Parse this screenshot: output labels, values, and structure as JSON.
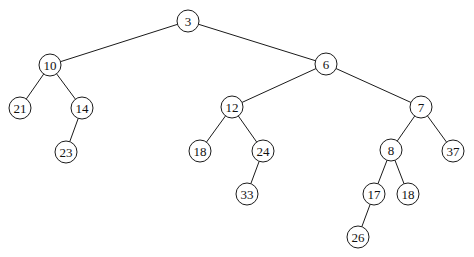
{
  "diagram": {
    "type": "binary-tree",
    "colors": {
      "stroke": "#1a1a1a",
      "fill": "#ffffff",
      "text": "#111111"
    },
    "node_radius": 11,
    "nodes": [
      {
        "id": "n3",
        "label": "3",
        "x": 188,
        "y": 21
      },
      {
        "id": "n10",
        "label": "10",
        "x": 50,
        "y": 65
      },
      {
        "id": "n6",
        "label": "6",
        "x": 326,
        "y": 64
      },
      {
        "id": "n21",
        "label": "21",
        "x": 20,
        "y": 108
      },
      {
        "id": "n14",
        "label": "14",
        "x": 82,
        "y": 108
      },
      {
        "id": "n12",
        "label": "12",
        "x": 232,
        "y": 107
      },
      {
        "id": "n7",
        "label": "7",
        "x": 421,
        "y": 107
      },
      {
        "id": "n23",
        "label": "23",
        "x": 66,
        "y": 152
      },
      {
        "id": "n18a",
        "label": "18",
        "x": 200,
        "y": 151
      },
      {
        "id": "n24",
        "label": "24",
        "x": 263,
        "y": 151
      },
      {
        "id": "n8",
        "label": "8",
        "x": 391,
        "y": 150
      },
      {
        "id": "n37",
        "label": "37",
        "x": 453,
        "y": 151
      },
      {
        "id": "n33",
        "label": "33",
        "x": 247,
        "y": 194
      },
      {
        "id": "n17",
        "label": "17",
        "x": 374,
        "y": 194
      },
      {
        "id": "n18b",
        "label": "18",
        "x": 408,
        "y": 194
      },
      {
        "id": "n26",
        "label": "26",
        "x": 358,
        "y": 237
      }
    ],
    "edges": [
      [
        "n3",
        "n10"
      ],
      [
        "n3",
        "n6"
      ],
      [
        "n10",
        "n21"
      ],
      [
        "n10",
        "n14"
      ],
      [
        "n14",
        "n23"
      ],
      [
        "n6",
        "n12"
      ],
      [
        "n6",
        "n7"
      ],
      [
        "n12",
        "n18a"
      ],
      [
        "n12",
        "n24"
      ],
      [
        "n24",
        "n33"
      ],
      [
        "n7",
        "n8"
      ],
      [
        "n7",
        "n37"
      ],
      [
        "n8",
        "n17"
      ],
      [
        "n8",
        "n18b"
      ],
      [
        "n17",
        "n26"
      ]
    ]
  }
}
